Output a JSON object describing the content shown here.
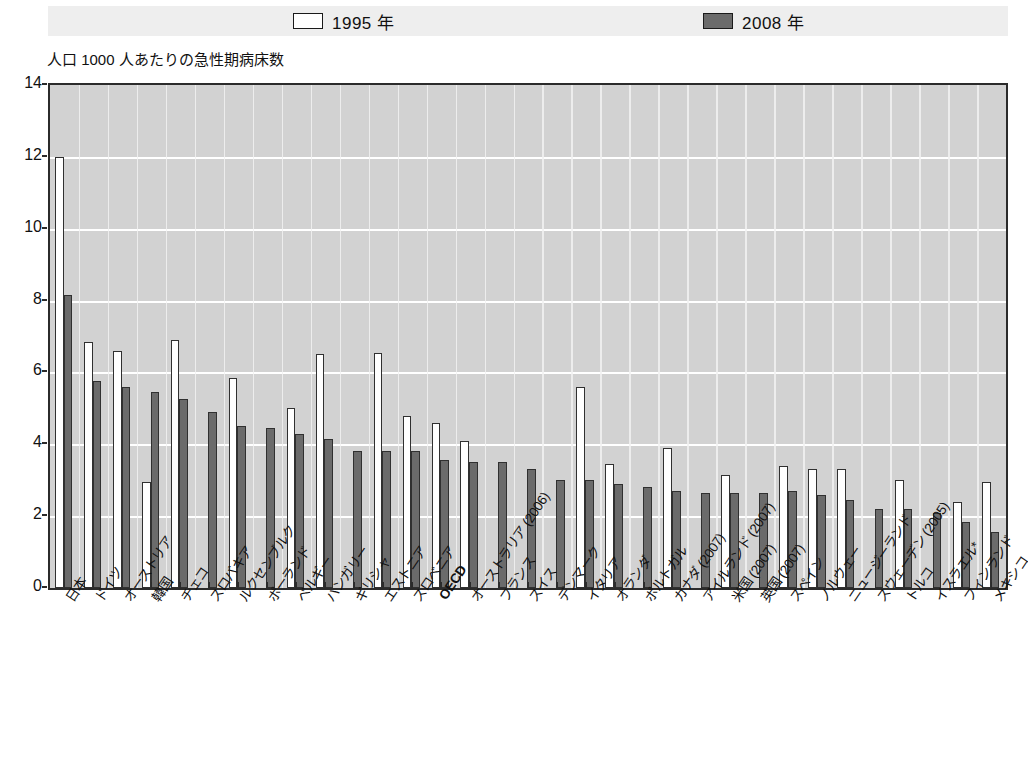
{
  "legend": {
    "items": [
      {
        "label": "1995 年",
        "swatch": "white-outlined-square",
        "color": "#ffffff"
      },
      {
        "label": "2008 年",
        "swatch": "dark-gray-filled-square",
        "color": "#6b6b6b"
      }
    ]
  },
  "axis_title": "人口 1000 人あたりの急性期病床数",
  "chart_data": {
    "type": "bar",
    "title": "",
    "subtitle": "",
    "xlabel": "",
    "ylabel": "人口 1000 人あたりの急性期病床数",
    "ylim": [
      0,
      14
    ],
    "yticks": [
      0,
      2,
      4,
      6,
      8,
      10,
      12,
      14
    ],
    "ytick_labels": [
      "0",
      "2",
      "4",
      "6",
      "8",
      "10",
      "12",
      "14"
    ],
    "grid": "horizontal-and-vertical",
    "legend_position": "top-center",
    "note": "イスラエル* には脚注記号あり",
    "categories": [
      "日本",
      "ドイツ",
      "オーストリア",
      "韓国",
      "チェコ",
      "スロバキア",
      "ルクセンブルク",
      "ポーランド",
      "ベルギー",
      "ハンガリー",
      "ギリシャ",
      "エストニア",
      "スロベニア",
      "OECD",
      "オーストラリア (2006)",
      "フランス",
      "スイス",
      "デンマーク",
      "イタリア",
      "オランダ",
      "ポルトガル",
      "カナダ (2007)",
      "アイルランド (2007)",
      "米国 (2007)",
      "英国 (2007)",
      "スペイン",
      "ノルウェー",
      "ニュージーランド",
      "スウェーデン (2005)",
      "トルコ",
      "イスラエル*",
      "フィンランド",
      "メキシコ"
    ],
    "series": [
      {
        "name": "1995 年",
        "color": "#ffffff",
        "values": [
          12.0,
          6.85,
          6.6,
          2.95,
          6.9,
          null,
          5.85,
          null,
          5.0,
          6.5,
          null,
          6.55,
          4.8,
          4.6,
          4.1,
          null,
          null,
          null,
          5.6,
          3.45,
          null,
          3.9,
          null,
          3.15,
          null,
          3.4,
          3.3,
          3.3,
          null,
          3.0,
          null,
          2.4,
          2.95
        ]
      },
      {
        "name": "2008 年",
        "color": "#6b6b6b",
        "values": [
          8.15,
          5.75,
          5.6,
          5.45,
          5.25,
          4.9,
          4.5,
          4.45,
          4.3,
          4.15,
          3.8,
          3.8,
          3.8,
          3.55,
          3.5,
          3.5,
          3.3,
          3.0,
          3.0,
          2.9,
          2.8,
          2.7,
          2.65,
          2.65,
          2.65,
          2.7,
          2.6,
          2.45,
          2.2,
          2.2,
          2.1,
          1.85,
          1.55
        ]
      }
    ]
  }
}
